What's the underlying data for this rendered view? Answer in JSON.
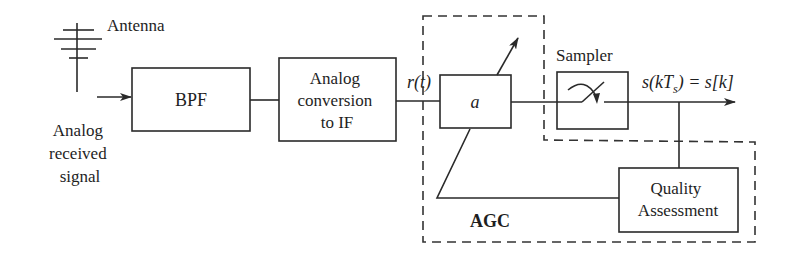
{
  "diagram": {
    "antenna_label": "Antenna",
    "input_label": [
      "Analog",
      "received",
      "signal"
    ],
    "blocks": {
      "bpf": "BPF",
      "conversion": [
        "Analog",
        "conversion",
        "to IF"
      ],
      "gain": "a",
      "sampler": "Sampler",
      "quality": [
        "Quality",
        "Assessment"
      ]
    },
    "signals": {
      "rt": "r(t)",
      "output_lhs_s": "s(kT",
      "output_lhs_sub": "s",
      "output_rhs": ") = s[k]"
    },
    "agc_label": "AGC"
  }
}
